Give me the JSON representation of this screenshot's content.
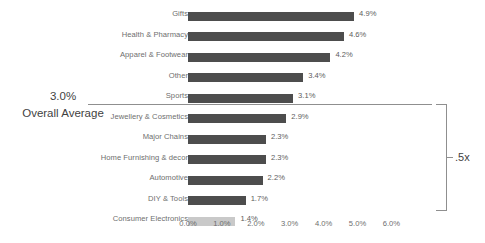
{
  "chart_data": {
    "type": "bar",
    "orientation": "horizontal",
    "title": "",
    "xlabel": "",
    "ylabel": "",
    "xlim": [
      0,
      6.0
    ],
    "grid": false,
    "legend": null,
    "categories": [
      "Gifts",
      "Health & Pharmacy",
      "Apparel & Footwear",
      "Other",
      "Sports",
      "Jewellery & Cosmetics",
      "Major Chains",
      "Home Furnishing & decor",
      "Automotive",
      "DIY & Tools",
      "Consumer Electronics"
    ],
    "values": [
      4.9,
      4.6,
      4.2,
      3.4,
      3.1,
      2.9,
      2.3,
      2.3,
      2.2,
      1.7,
      1.4
    ],
    "value_labels": [
      "4.9%",
      "4.6%",
      "4.2%",
      "3.4%",
      "3.1%",
      "2.9%",
      "2.3%",
      "2.3%",
      "2.2%",
      "1.7%",
      "1.4%"
    ],
    "bar_colors": [
      "#4d4d4d",
      "#4d4d4d",
      "#4d4d4d",
      "#4d4d4d",
      "#4d4d4d",
      "#4d4d4d",
      "#4d4d4d",
      "#4d4d4d",
      "#4d4d4d",
      "#4d4d4d",
      "#c9c9c9"
    ],
    "highlight_category": "Consumer Electronics",
    "xticks": [
      0,
      1,
      2,
      3,
      4,
      5,
      6
    ],
    "xtick_labels": [
      "0.0%",
      "1.0%",
      "2.0%",
      "3.0%",
      "4.0%",
      "5.0%",
      "6.0%"
    ],
    "annotations": {
      "average_value": "3.0%",
      "average_caption": "Overall Average",
      "bracket_label": ".5x"
    }
  },
  "colors": {
    "bar_dark": "#4d4d4d",
    "bar_light": "#c9c9c9",
    "text": "#6e6e6e",
    "annotation_text": "#3f3f3f",
    "rule": "#8f8f8f",
    "background": "#ffffff"
  }
}
